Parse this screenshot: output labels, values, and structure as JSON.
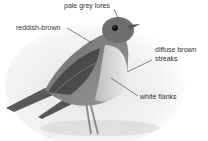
{
  "figure": {
    "labels": [
      {
        "text": "pale grey lores"
      },
      {
        "text": "reddish-brown"
      },
      {
        "text": "diffuse brown"
      },
      {
        "text": "streaks"
      },
      {
        "text": "white flanks"
      }
    ]
  }
}
